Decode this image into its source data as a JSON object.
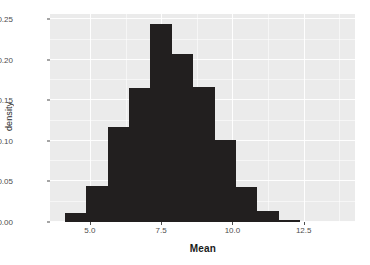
{
  "chart_data": {
    "type": "bar",
    "title": "",
    "subtitle": "",
    "xlabel": "Mean",
    "ylabel": "density",
    "xlim": [
      3.6,
      14.3
    ],
    "ylim": [
      0.0,
      0.2565
    ],
    "grid": true,
    "legend": "none",
    "bin_width": 0.75,
    "x_ticks": [
      {
        "value": 5.0,
        "label": "5.0"
      },
      {
        "value": 7.5,
        "label": "7.5"
      },
      {
        "value": 10.0,
        "label": "10.0"
      },
      {
        "value": 12.5,
        "label": "12.5"
      }
    ],
    "x_minor_ticks": [
      6.25,
      8.75,
      11.25,
      13.75
    ],
    "y_ticks": [
      {
        "value": 0.0,
        "label": "0.00"
      },
      {
        "value": 0.05,
        "label": "0.05"
      },
      {
        "value": 0.1,
        "label": "0.10"
      },
      {
        "value": 0.15,
        "label": "0.15"
      },
      {
        "value": 0.2,
        "label": "0.20"
      },
      {
        "value": 0.25,
        "label": "0.25"
      }
    ],
    "y_minor_ticks": [
      0.025,
      0.075,
      0.125,
      0.175,
      0.225
    ],
    "categories": [
      "4.25",
      "5.00",
      "5.75",
      "6.50",
      "7.25",
      "8.00",
      "8.75",
      "9.50",
      "10.25",
      "11.00",
      "11.75"
    ],
    "bins": [
      {
        "x0": 4.125,
        "x1": 4.875,
        "center": 4.5,
        "value": 0.011
      },
      {
        "x0": 4.875,
        "x1": 5.625,
        "center": 5.25,
        "value": 0.045
      },
      {
        "x0": 5.625,
        "x1": 6.375,
        "center": 6.0,
        "value": 0.117
      },
      {
        "x0": 6.375,
        "x1": 7.125,
        "center": 6.75,
        "value": 0.165
      },
      {
        "x0": 7.125,
        "x1": 7.875,
        "center": 7.5,
        "value": 0.244
      },
      {
        "x0": 7.875,
        "x1": 8.625,
        "center": 8.25,
        "value": 0.207
      },
      {
        "x0": 8.625,
        "x1": 9.375,
        "center": 9.0,
        "value": 0.166
      },
      {
        "x0": 9.375,
        "x1": 10.125,
        "center": 9.75,
        "value": 0.101
      },
      {
        "x0": 10.125,
        "x1": 10.875,
        "center": 10.5,
        "value": 0.043
      },
      {
        "x0": 10.875,
        "x1": 11.625,
        "center": 11.25,
        "value": 0.013
      },
      {
        "x0": 11.625,
        "x1": 12.375,
        "center": 12.0,
        "value": 0.003
      }
    ],
    "values": [
      0.011,
      0.045,
      0.117,
      0.165,
      0.244,
      0.207,
      0.166,
      0.101,
      0.043,
      0.013,
      0.003
    ],
    "colors": {
      "bar": "#221f1f",
      "panel_background": "#ebebeb",
      "plot_background": "#ffffff",
      "gridline": "#ffffff",
      "axis_text": "#4d4d4d",
      "axis_title": "#1a1a1a"
    }
  }
}
